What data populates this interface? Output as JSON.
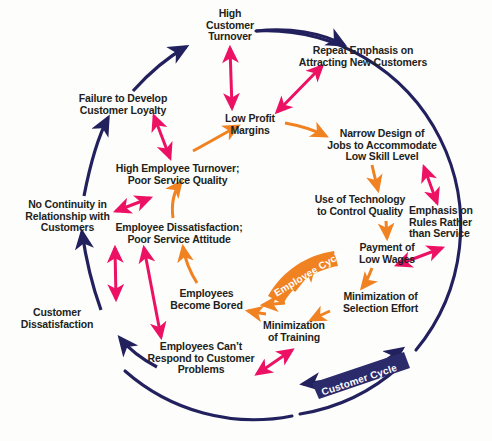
{
  "diagram": {
    "colors": {
      "navy": "#22215e",
      "orange": "#f08221",
      "pink": "#ed1164",
      "text": "#231f20",
      "background": "#fdfdfc",
      "banner_text": "#ffffff"
    },
    "banners": [
      {
        "id": "employee-cycle",
        "label": "Employee Cycle",
        "color": "#f08221"
      },
      {
        "id": "customer-cycle",
        "label": "Customer Cycle",
        "color": "#22215e"
      }
    ],
    "nodes": [
      {
        "id": "high-customer-turnover",
        "label": "High\nCustomer\nTurnover",
        "x": 190,
        "y": 8,
        "w": 80,
        "align": "center"
      },
      {
        "id": "repeat-emphasis-attracting-new-customers",
        "label": "Repeat Emphasis on\nAttracting New Customers",
        "x": 293,
        "y": 45,
        "w": 140,
        "align": "center"
      },
      {
        "id": "failure-to-develop-customer-loyalty",
        "label": "Failure to Develop\nCustomer Loyalty",
        "x": 68,
        "y": 93,
        "w": 110,
        "align": "center"
      },
      {
        "id": "low-profit-margins",
        "label": "Low Profit\nMargins",
        "x": 217,
        "y": 113,
        "w": 66,
        "align": "center"
      },
      {
        "id": "narrow-design-of-jobs",
        "label": "Narrow Design of\nJobs to Accommodate\nLow Skill Level",
        "x": 320,
        "y": 128,
        "w": 124,
        "align": "center"
      },
      {
        "id": "high-employee-turnover",
        "label": "High Employee Turnover;\nPoor Service Quality",
        "x": 105,
        "y": 163,
        "w": 145,
        "align": "center"
      },
      {
        "id": "use-of-technology",
        "label": "Use of Technology\nto Control Quality",
        "x": 305,
        "y": 194,
        "w": 110,
        "align": "center"
      },
      {
        "id": "emphasis-on-rules",
        "label": "Emphasis on\nRules Rather\nthan Service",
        "x": 409,
        "y": 205,
        "w": 78,
        "align": "left"
      },
      {
        "id": "no-continuity-in-relationship",
        "label": "No Continuity in\nRelationship with\nCustomers",
        "x": 15,
        "y": 199,
        "w": 105,
        "align": "center"
      },
      {
        "id": "employee-dissatisfaction",
        "label": "Employee Dissatisfaction;\nPoor Service Attitude",
        "x": 103,
        "y": 222,
        "w": 152,
        "align": "center"
      },
      {
        "id": "payment-of-low-wages",
        "label": "Payment of\nLow Wages",
        "x": 350,
        "y": 242,
        "w": 74,
        "align": "center"
      },
      {
        "id": "employees-become-bored",
        "label": "Employees\nBecome Bored",
        "x": 165,
        "y": 288,
        "w": 83,
        "align": "center"
      },
      {
        "id": "minimization-of-selection-effort",
        "label": "Minimization of\nSelection Effort",
        "x": 333,
        "y": 291,
        "w": 95,
        "align": "center"
      },
      {
        "id": "customer-dissatisfaction",
        "label": "Customer\nDissatisfaction",
        "x": 11,
        "y": 307,
        "w": 92,
        "align": "center"
      },
      {
        "id": "minimization-of-training",
        "label": "Minimization\nof Training",
        "x": 254,
        "y": 320,
        "w": 80,
        "align": "center"
      },
      {
        "id": "employees-cant-respond",
        "label": "Employees Can’t\nRespond to Customer\nProblems",
        "x": 140,
        "y": 341,
        "w": 122,
        "align": "center"
      }
    ]
  }
}
